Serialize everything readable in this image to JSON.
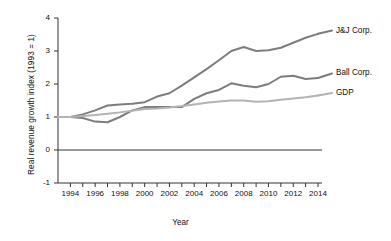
{
  "chart_data": {
    "type": "line",
    "title": "",
    "xlabel": "Year",
    "ylabel": "Real revenue growth index (1993 = 1)",
    "xlim": [
      1993,
      2014
    ],
    "ylim": [
      -1,
      4
    ],
    "grid": false,
    "legend_position": "right-inline-labels",
    "yticks": [
      "4",
      "3",
      "2",
      "1",
      "0",
      "-1"
    ],
    "ytick_values": [
      4,
      3,
      2,
      1,
      0,
      -1
    ],
    "xticks": [
      "1994",
      "1996",
      "1998",
      "2000",
      "2002",
      "2004",
      "2006",
      "2008",
      "2010",
      "2012",
      "2014"
    ],
    "xtick_values": [
      1994,
      1996,
      1998,
      2000,
      2002,
      2004,
      2006,
      2008,
      2010,
      2012,
      2014
    ],
    "x": [
      1993,
      1994,
      1995,
      1996,
      1997,
      1998,
      1999,
      2000,
      2001,
      2002,
      2003,
      2004,
      2005,
      2006,
      2007,
      2008,
      2009,
      2010,
      2011,
      2012,
      2013,
      2014
    ],
    "reference_line": {
      "y": 0,
      "color": "#333333"
    },
    "series": [
      {
        "name": "J&J Corp.",
        "color": "#7d7d7d",
        "label_y_value": 3.62,
        "values": [
          1.0,
          1.0,
          1.08,
          1.2,
          1.35,
          1.38,
          1.4,
          1.45,
          1.62,
          1.72,
          1.95,
          2.2,
          2.45,
          2.72,
          3.0,
          3.12,
          3.0,
          3.02,
          3.1,
          3.25,
          3.4,
          3.52
        ]
      },
      {
        "name": "Ball Corp.",
        "color": "#7d7d7d",
        "label_y_value": 2.32,
        "values": [
          1.0,
          1.0,
          0.97,
          0.86,
          0.84,
          1.0,
          1.2,
          1.3,
          1.3,
          1.3,
          1.3,
          1.55,
          1.72,
          1.82,
          2.02,
          1.95,
          1.9,
          2.0,
          2.22,
          2.25,
          2.15,
          2.18
        ]
      },
      {
        "name": "GDP",
        "color": "#b3b3b3",
        "label_y_value": 1.73,
        "values": [
          1.0,
          1.0,
          1.03,
          1.06,
          1.1,
          1.14,
          1.19,
          1.24,
          1.26,
          1.29,
          1.33,
          1.38,
          1.43,
          1.47,
          1.5,
          1.5,
          1.46,
          1.48,
          1.52,
          1.56,
          1.6,
          1.65
        ]
      }
    ]
  }
}
